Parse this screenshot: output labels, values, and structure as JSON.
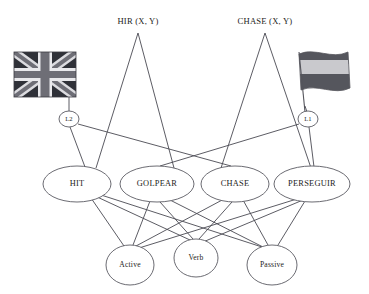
{
  "diagram": {
    "background_color": "#ffffff",
    "line_color": "#4a4a52",
    "node_fill": "#ffffff",
    "text_color": "#1d1d22"
  },
  "concepts": [
    {
      "id": "hir",
      "label": "HIR (X, Y)",
      "x": 138,
      "y": 22
    },
    {
      "id": "chase_concept",
      "label": "CHASE (X, Y)",
      "x": 265,
      "y": 22
    }
  ],
  "flags": [
    {
      "id": "uk-flag",
      "name": "union-jack-flag",
      "description": "United Kingdom flag, grayscale",
      "x": 14,
      "y": 52,
      "width": 62,
      "height": 45,
      "field_color": "#2f3138",
      "stripe_color": "#e9e9ec",
      "cross_color": "#6e6e76"
    },
    {
      "id": "es-flag",
      "name": "spanish-flag",
      "description": "Spanish flag, grayscale, waving on pole",
      "x": 296,
      "y": 50,
      "width": 64,
      "height": 42,
      "outer_stripe_color": "#55565d",
      "middle_stripe_color": "#c9c9cd",
      "pole_color": "#55555c"
    }
  ],
  "language_nodes": [
    {
      "id": "l2",
      "label": "L2",
      "x": 69,
      "y": 119,
      "rx": 10,
      "ry": 8
    },
    {
      "id": "l1",
      "label": "L1",
      "x": 308,
      "y": 119,
      "rx": 10,
      "ry": 8
    }
  ],
  "lexical_nodes": [
    {
      "id": "hit",
      "label": "HIT",
      "x": 77,
      "y": 184,
      "rx": 34,
      "ry": 18
    },
    {
      "id": "golpear",
      "label": "GOLPEAR",
      "x": 157,
      "y": 184,
      "rx": 37,
      "ry": 18
    },
    {
      "id": "chase",
      "label": "CHASE",
      "x": 235,
      "y": 184,
      "rx": 34,
      "ry": 18
    },
    {
      "id": "perseguir",
      "label": "PERSEGUIR",
      "x": 312,
      "y": 184,
      "rx": 38,
      "ry": 18
    }
  ],
  "feature_nodes": [
    {
      "id": "active",
      "label": "Active",
      "x": 130,
      "y": 265,
      "rx": 24,
      "ry": 20
    },
    {
      "id": "verb",
      "label": "Verb",
      "x": 196,
      "y": 258,
      "rx": 22,
      "ry": 19
    },
    {
      "id": "passive",
      "label": "Passive",
      "x": 272,
      "y": 265,
      "rx": 25,
      "ry": 20
    }
  ],
  "edges": [
    {
      "from": "hir",
      "to": "hit"
    },
    {
      "from": "hir",
      "to": "golpear"
    },
    {
      "from": "chase_concept",
      "to": "chase"
    },
    {
      "from": "chase_concept",
      "to": "perseguir"
    },
    {
      "from": "uk-flag",
      "to": "l2"
    },
    {
      "from": "es-flag",
      "to": "l1"
    },
    {
      "from": "l2",
      "to": "hit"
    },
    {
      "from": "l2",
      "to": "chase"
    },
    {
      "from": "l1",
      "to": "perseguir"
    },
    {
      "from": "l1",
      "to": "golpear"
    },
    {
      "from": "hit",
      "to": "active"
    },
    {
      "from": "hit",
      "to": "verb"
    },
    {
      "from": "hit",
      "to": "passive"
    },
    {
      "from": "golpear",
      "to": "active"
    },
    {
      "from": "golpear",
      "to": "verb"
    },
    {
      "from": "golpear",
      "to": "passive"
    },
    {
      "from": "chase",
      "to": "active"
    },
    {
      "from": "chase",
      "to": "verb"
    },
    {
      "from": "chase",
      "to": "passive"
    },
    {
      "from": "perseguir",
      "to": "active"
    },
    {
      "from": "perseguir",
      "to": "verb"
    },
    {
      "from": "perseguir",
      "to": "passive"
    }
  ]
}
